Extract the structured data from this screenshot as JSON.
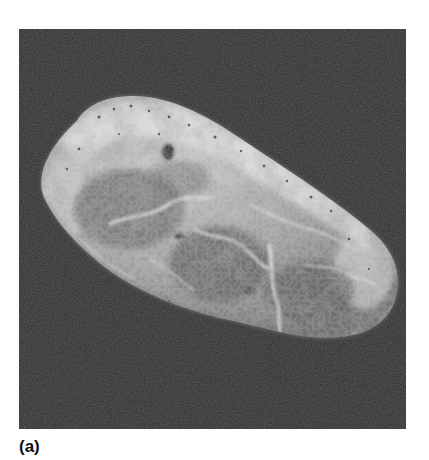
{
  "figure": {
    "panel_label": "(a)",
    "image": {
      "type": "grayscale-micrograph",
      "subject": "elongated-particle",
      "background_color": "#2a2a2a",
      "particle_highlight_color": "#d8d8d8",
      "particle_midtone_color": "#8a8a8a",
      "particle_shadow_color": "#5a5a5a"
    }
  }
}
